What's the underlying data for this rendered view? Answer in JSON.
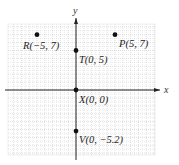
{
  "chart_data": {
    "type": "scatter",
    "title": "",
    "xlabel": "x",
    "ylabel": "y",
    "xlim": [
      -9,
      10
    ],
    "ylim": [
      -8.5,
      8.5
    ],
    "grid": true,
    "points": [
      {
        "name": "R",
        "x": -5,
        "y": 7,
        "label": "R(−5, 7)"
      },
      {
        "name": "P",
        "x": 5,
        "y": 7,
        "label": "P(5, 7)"
      },
      {
        "name": "T",
        "x": 0,
        "y": 5,
        "label": "T(0, 5)"
      },
      {
        "name": "X",
        "x": 0,
        "y": 0,
        "label": "X(0, 0)"
      },
      {
        "name": "V",
        "x": 0,
        "y": -5.2,
        "label": "V(0, −5.2)"
      }
    ]
  },
  "axes": {
    "x_label": "x",
    "y_label": "y"
  },
  "colors": {
    "grid": "#c8c8c8",
    "axis": "#222222",
    "point": "#111111"
  }
}
